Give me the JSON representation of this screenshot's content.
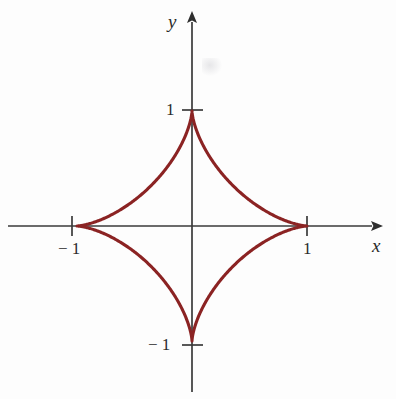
{
  "figure": {
    "title": "",
    "background_color": "#fdfdfd",
    "curve_color": "#8b2323",
    "axis_color": "#3a3a3a",
    "text_color": "#2b2b2b"
  },
  "axes": {
    "x_label": "x",
    "y_label": "y",
    "x_ticks": [
      {
        "value": -1,
        "label": "− 1"
      },
      {
        "value": 1,
        "label": "1"
      }
    ],
    "y_ticks": [
      {
        "value": 1,
        "label": "1"
      },
      {
        "value": -1,
        "label": "− 1"
      }
    ],
    "origin_px": [
      192,
      226
    ],
    "unit_px": 115,
    "x_arrow": "right",
    "y_arrow": "up"
  },
  "chart_data": {
    "type": "line",
    "title": "",
    "xlabel": "x",
    "ylabel": "y",
    "equation": "x^(2/3) + y^(2/3) = 1",
    "curve_name": "astroid",
    "parametric": {
      "x": "cos(t)^3",
      "y": "sin(t)^3",
      "t_range": [
        0,
        6.283185307179586
      ]
    },
    "xlim": [
      -1.6,
      1.75
    ],
    "ylim": [
      -1.45,
      1.88
    ],
    "grid": false,
    "legend": null,
    "cusps": [
      [
        1,
        0
      ],
      [
        0,
        1
      ],
      [
        -1,
        0
      ],
      [
        0,
        -1
      ]
    ],
    "xticks": [
      -1,
      1
    ],
    "yticks": [
      -1,
      1
    ],
    "series": [
      {
        "name": "astroid",
        "color": "#8b2323",
        "x": [
          1.0,
          0.9672,
          0.8752,
          0.7392,
          0.5798,
          0.4193,
          0.2778,
          0.1684,
          0.0915,
          0.0427,
          0.0152,
          0.0029,
          0.0,
          -0.0029,
          -0.0152,
          -0.0427,
          -0.0915,
          -0.1684,
          -0.2778,
          -0.4193,
          -0.5798,
          -0.7392,
          -0.8752,
          -0.9672,
          -1.0,
          -0.9672,
          -0.8752,
          -0.7392,
          -0.5798,
          -0.4193,
          -0.2778,
          -0.1684,
          -0.0915,
          -0.0427,
          -0.0152,
          -0.0029,
          0.0,
          0.0029,
          0.0152,
          0.0427,
          0.0915,
          0.1684,
          0.2778,
          0.4193,
          0.5798,
          0.7392,
          0.8752,
          0.9672,
          1.0
        ],
        "y": [
          0.0,
          0.0029,
          0.0152,
          0.0427,
          0.0915,
          0.1684,
          0.2778,
          0.4193,
          0.5798,
          0.7392,
          0.8752,
          0.9672,
          1.0,
          0.9672,
          0.8752,
          0.7392,
          0.5798,
          0.4193,
          0.2778,
          0.1684,
          0.0915,
          0.0427,
          0.0152,
          0.0029,
          0.0,
          -0.0029,
          -0.0152,
          -0.0427,
          -0.0915,
          -0.1684,
          -0.2778,
          -0.4193,
          -0.5798,
          -0.7392,
          -0.8752,
          -0.9672,
          -1.0,
          -0.9672,
          -0.8752,
          -0.7392,
          -0.5798,
          -0.4193,
          -0.2778,
          -0.1684,
          -0.0915,
          -0.0427,
          -0.0152,
          -0.0029,
          0.0
        ]
      }
    ]
  }
}
